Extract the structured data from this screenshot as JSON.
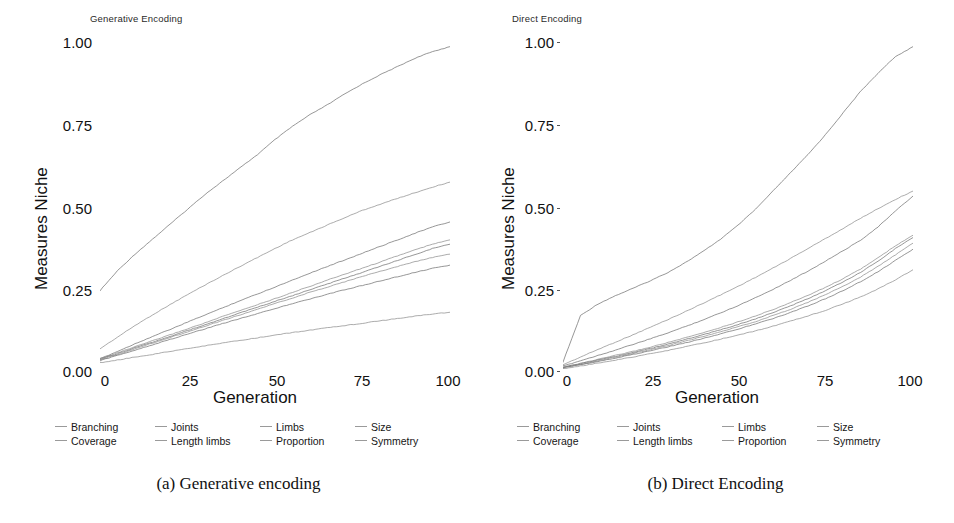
{
  "figure": {
    "captions": [
      {
        "id": "a",
        "text": "(a) Generative encoding"
      },
      {
        "id": "b",
        "text": "(b) Direct Encoding"
      }
    ]
  },
  "legend": {
    "entries": [
      "Branching",
      "Coverage",
      "Joints",
      "Length limbs",
      "Limbs",
      "Proportion",
      "Size",
      "Symmetry"
    ],
    "columns": [
      [
        "Branching",
        "Coverage"
      ],
      [
        "Joints",
        "Length limbs"
      ],
      [
        "Limbs",
        "Proportion"
      ],
      [
        "Size",
        "Symmetry"
      ]
    ],
    "marker": "line-dash",
    "position": "bottom"
  },
  "axes": {
    "xlabel": "Generation",
    "ylabel": "Measures Niche",
    "xticks": [
      "0",
      "25",
      "50",
      "75",
      "100"
    ],
    "yticks": [
      "0.00",
      "0.25",
      "0.50",
      "0.75",
      "1.00"
    ],
    "xlim": [
      0,
      100
    ],
    "ylim": [
      0.0,
      1.0
    ],
    "grid": false
  },
  "colors": {
    "line": "#8c8c8c",
    "line_dark": "#6e6e6e",
    "text": "#111111",
    "background": "#ffffff",
    "legend_dash": "#9a9a9a"
  },
  "chart_data": [
    {
      "type": "line",
      "title": "Generative Encoding",
      "panel": "a",
      "xlabel": "Generation",
      "ylabel": "Measures Niche",
      "xlim": [
        0,
        100
      ],
      "ylim": [
        0.0,
        1.0
      ],
      "xticks": [
        0,
        25,
        50,
        75,
        100
      ],
      "yticks": [
        0.0,
        0.25,
        0.5,
        0.75,
        1.0
      ],
      "grid": false,
      "legend_position": "bottom",
      "x": [
        0,
        5,
        10,
        15,
        20,
        25,
        30,
        35,
        40,
        45,
        50,
        55,
        60,
        65,
        70,
        75,
        80,
        85,
        90,
        95,
        100
      ],
      "series": [
        {
          "name": "Coverage",
          "values": [
            0.245,
            0.305,
            0.355,
            0.4,
            0.445,
            0.49,
            0.535,
            0.575,
            0.615,
            0.655,
            0.7,
            0.74,
            0.775,
            0.805,
            0.838,
            0.868,
            0.895,
            0.92,
            0.945,
            0.965,
            0.98
          ]
        },
        {
          "name": "Branching",
          "values": [
            0.07,
            0.105,
            0.14,
            0.172,
            0.203,
            0.233,
            0.262,
            0.29,
            0.318,
            0.345,
            0.372,
            0.398,
            0.42,
            0.443,
            0.465,
            0.487,
            0.505,
            0.523,
            0.54,
            0.557,
            0.572
          ]
        },
        {
          "name": "Joints",
          "values": [
            0.04,
            0.062,
            0.085,
            0.107,
            0.128,
            0.15,
            0.172,
            0.193,
            0.215,
            0.235,
            0.256,
            0.277,
            0.298,
            0.318,
            0.338,
            0.358,
            0.378,
            0.398,
            0.418,
            0.437,
            0.452
          ]
        },
        {
          "name": "Limbs",
          "values": [
            0.04,
            0.058,
            0.076,
            0.094,
            0.112,
            0.13,
            0.148,
            0.167,
            0.185,
            0.203,
            0.221,
            0.24,
            0.258,
            0.277,
            0.295,
            0.313,
            0.331,
            0.35,
            0.368,
            0.385,
            0.398
          ]
        },
        {
          "name": "Length limbs",
          "values": [
            0.038,
            0.055,
            0.073,
            0.09,
            0.107,
            0.125,
            0.142,
            0.16,
            0.178,
            0.195,
            0.213,
            0.23,
            0.248,
            0.265,
            0.283,
            0.3,
            0.318,
            0.336,
            0.354,
            0.372,
            0.385
          ]
        },
        {
          "name": "Proportion",
          "values": [
            0.036,
            0.053,
            0.07,
            0.087,
            0.104,
            0.121,
            0.138,
            0.155,
            0.172,
            0.189,
            0.206,
            0.223,
            0.24,
            0.256,
            0.272,
            0.288,
            0.303,
            0.318,
            0.332,
            0.345,
            0.355
          ]
        },
        {
          "name": "Size",
          "values": [
            0.034,
            0.05,
            0.066,
            0.082,
            0.098,
            0.114,
            0.13,
            0.146,
            0.161,
            0.176,
            0.191,
            0.206,
            0.22,
            0.234,
            0.248,
            0.261,
            0.274,
            0.287,
            0.3,
            0.312,
            0.322
          ]
        },
        {
          "name": "Symmetry",
          "values": [
            0.028,
            0.036,
            0.045,
            0.053,
            0.062,
            0.07,
            0.079,
            0.087,
            0.095,
            0.103,
            0.111,
            0.119,
            0.126,
            0.133,
            0.14,
            0.147,
            0.154,
            0.161,
            0.168,
            0.175,
            0.18
          ]
        }
      ]
    },
    {
      "type": "line",
      "title": "Direct Encoding",
      "panel": "b",
      "xlabel": "Generation",
      "ylabel": "Measures Niche",
      "xlim": [
        0,
        100
      ],
      "ylim": [
        0.0,
        1.0
      ],
      "xticks": [
        0,
        25,
        50,
        75,
        100
      ],
      "yticks": [
        0.0,
        0.25,
        0.5,
        0.75,
        1.0
      ],
      "grid": false,
      "legend_position": "bottom",
      "x": [
        0,
        5,
        10,
        15,
        20,
        25,
        30,
        35,
        40,
        45,
        50,
        55,
        60,
        65,
        70,
        75,
        80,
        85,
        90,
        95,
        100
      ],
      "series": [
        {
          "name": "Coverage",
          "values": [
            0.03,
            0.17,
            0.205,
            0.23,
            0.252,
            0.275,
            0.3,
            0.33,
            0.363,
            0.4,
            0.442,
            0.49,
            0.545,
            0.6,
            0.655,
            0.715,
            0.78,
            0.845,
            0.9,
            0.95,
            0.98
          ]
        },
        {
          "name": "Branching",
          "values": [
            0.022,
            0.045,
            0.068,
            0.09,
            0.112,
            0.135,
            0.158,
            0.182,
            0.207,
            0.232,
            0.258,
            0.285,
            0.313,
            0.342,
            0.372,
            0.402,
            0.432,
            0.463,
            0.492,
            0.52,
            0.545
          ]
        },
        {
          "name": "Joints",
          "values": [
            0.018,
            0.034,
            0.05,
            0.066,
            0.083,
            0.1,
            0.118,
            0.137,
            0.157,
            0.178,
            0.2,
            0.224,
            0.249,
            0.276,
            0.304,
            0.334,
            0.365,
            0.397,
            0.437,
            0.485,
            0.53
          ]
        },
        {
          "name": "Limbs",
          "values": [
            0.015,
            0.026,
            0.038,
            0.05,
            0.062,
            0.075,
            0.089,
            0.103,
            0.118,
            0.134,
            0.151,
            0.169,
            0.188,
            0.209,
            0.231,
            0.255,
            0.281,
            0.31,
            0.344,
            0.38,
            0.412
          ]
        },
        {
          "name": "Length limbs",
          "values": [
            0.014,
            0.025,
            0.036,
            0.047,
            0.059,
            0.071,
            0.084,
            0.098,
            0.112,
            0.127,
            0.143,
            0.16,
            0.179,
            0.199,
            0.221,
            0.245,
            0.271,
            0.3,
            0.334,
            0.372,
            0.405
          ]
        },
        {
          "name": "Proportion",
          "values": [
            0.013,
            0.023,
            0.034,
            0.045,
            0.056,
            0.068,
            0.08,
            0.093,
            0.107,
            0.121,
            0.136,
            0.152,
            0.17,
            0.189,
            0.21,
            0.233,
            0.258,
            0.286,
            0.318,
            0.353,
            0.388
          ]
        },
        {
          "name": "Size",
          "values": [
            0.012,
            0.022,
            0.032,
            0.042,
            0.053,
            0.064,
            0.076,
            0.088,
            0.101,
            0.115,
            0.129,
            0.145,
            0.161,
            0.179,
            0.199,
            0.221,
            0.245,
            0.272,
            0.302,
            0.336,
            0.37
          ]
        },
        {
          "name": "Symmetry",
          "values": [
            0.01,
            0.018,
            0.027,
            0.036,
            0.045,
            0.055,
            0.065,
            0.076,
            0.087,
            0.099,
            0.111,
            0.124,
            0.138,
            0.153,
            0.169,
            0.186,
            0.205,
            0.226,
            0.25,
            0.278,
            0.308
          ]
        }
      ]
    }
  ]
}
